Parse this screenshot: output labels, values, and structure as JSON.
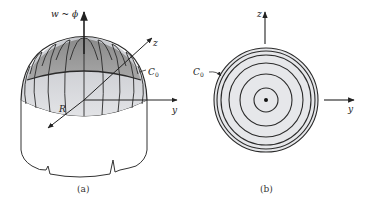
{
  "figure_a": {
    "caption": "(a)",
    "labels": {
      "vertical_axis": "w ~ ϕ",
      "z_axis": "z",
      "y_axis": "y",
      "radius": "R",
      "contour": "C",
      "contour_sub": "0"
    }
  },
  "figure_b": {
    "caption": "(b)",
    "labels": {
      "z_axis": "z",
      "y_axis": "y",
      "contour": "C",
      "contour_sub": "0"
    },
    "ring_count": 6
  },
  "colors": {
    "line": "#2a2a2a",
    "dome_dark": "#8c8c8c",
    "dome_light": "#d6d8dc",
    "disk_fill": "#e4e5e8"
  }
}
